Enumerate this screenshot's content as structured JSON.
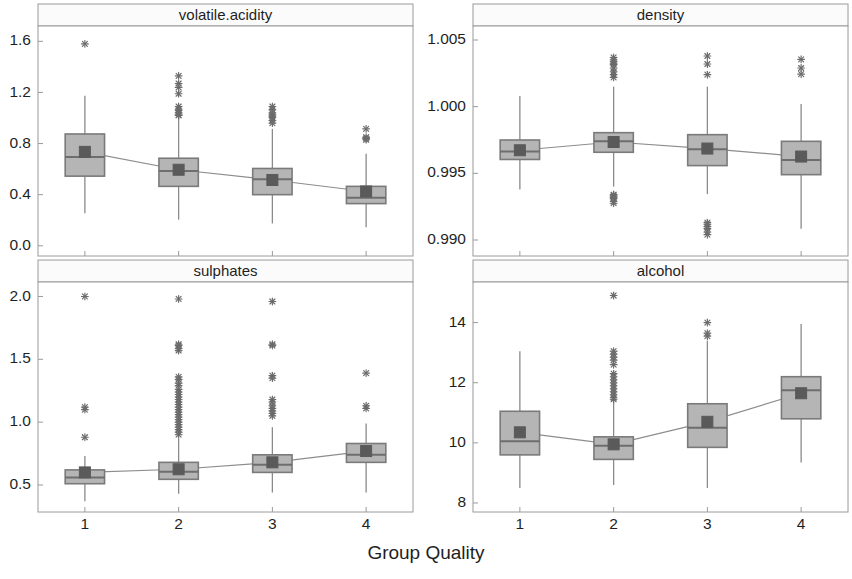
{
  "figure": {
    "background": "#ffffff",
    "xlabel": "Group Quality",
    "title_clipped": "",
    "panel_border_color": "#9a9a9a",
    "strip_background": "#fbfbfb",
    "strip_text_color": "#1f1f1f",
    "box_fill": "#b5b5b5",
    "box_border": "#7a7a7a",
    "whisker_color": "#8a8a8a",
    "median_color": "#6e6e6e",
    "outlier_color": "#6b6b6b",
    "mean_marker_color": "#5a5a5a",
    "mean_line_color": "#8d8d8d"
  },
  "chart_data": [
    {
      "type": "box",
      "panel": "top-left",
      "title": "volatile.acidity",
      "xlabel": "Group Quality",
      "ylabel": "",
      "categories": [
        "1",
        "2",
        "3",
        "4"
      ],
      "ylim": [
        -0.08,
        1.72
      ],
      "yticks": [
        0.0,
        0.4,
        0.8,
        1.2,
        1.6
      ],
      "ytick_labels": [
        "0.0",
        "0.4",
        "0.8",
        "1.2",
        "1.6"
      ],
      "grid": false,
      "boxes": [
        {
          "category": "1",
          "min": 0.255,
          "q1": 0.545,
          "median": 0.695,
          "q3": 0.875,
          "max": 1.175,
          "mean": 0.735,
          "outliers": [
            1.58
          ]
        },
        {
          "category": "2",
          "min": 0.205,
          "q1": 0.465,
          "median": 0.585,
          "q3": 0.685,
          "max": 1.005,
          "mean": 0.595,
          "outliers": [
            1.33,
            1.27,
            1.24,
            1.19,
            1.09,
            1.07,
            1.06,
            1.04,
            1.025,
            1.02
          ]
        },
        {
          "category": "3",
          "min": 0.175,
          "q1": 0.4,
          "median": 0.52,
          "q3": 0.605,
          "max": 0.915,
          "mean": 0.515,
          "outliers": [
            1.09,
            1.065,
            1.04,
            1.025,
            1.015,
            1.005,
            0.98,
            0.96
          ]
        },
        {
          "category": "4",
          "min": 0.145,
          "q1": 0.33,
          "median": 0.375,
          "q3": 0.465,
          "max": 0.72,
          "mean": 0.425,
          "outliers": [
            0.915,
            0.85,
            0.84,
            0.83
          ]
        }
      ],
      "mean_trend": [
        0.735,
        0.595,
        0.515,
        0.425
      ]
    },
    {
      "type": "box",
      "panel": "top-right",
      "title": "density",
      "xlabel": "Group Quality",
      "ylabel": "",
      "categories": [
        "1",
        "2",
        "3",
        "4"
      ],
      "ylim": [
        0.9888,
        1.00605
      ],
      "yticks": [
        0.99,
        0.995,
        1.0,
        1.005
      ],
      "ytick_labels": [
        "0.990",
        "0.995",
        "1.000",
        "1.005"
      ],
      "grid": false,
      "boxes": [
        {
          "category": "1",
          "min": 0.99378,
          "q1": 0.99604,
          "median": 0.99664,
          "q3": 0.9975,
          "max": 1.0008,
          "mean": 0.99673,
          "outliers": []
        },
        {
          "category": "2",
          "min": 0.994,
          "q1": 0.99658,
          "median": 0.9974,
          "q3": 0.99805,
          "max": 1.0015,
          "mean": 0.99735,
          "outliers": [
            1.00369,
            1.00352,
            1.00339,
            1.00326,
            1.00315,
            1.0029,
            1.00262,
            1.0024,
            1.0022,
            0.99341,
            0.99336,
            0.99328,
            0.9932,
            0.9931,
            0.9929,
            0.99276
          ]
        },
        {
          "category": "3",
          "min": 0.99344,
          "q1": 0.99558,
          "median": 0.9968,
          "q3": 0.9979,
          "max": 1.0015,
          "mean": 0.99686,
          "outliers": [
            1.0038,
            1.0032,
            1.0024,
            0.9913,
            0.99118,
            0.991,
            0.99085,
            0.9906,
            0.9904
          ]
        },
        {
          "category": "4",
          "min": 0.99084,
          "q1": 0.9949,
          "median": 0.996,
          "q3": 0.9974,
          "max": 1.0002,
          "mean": 0.99626,
          "outliers": [
            1.00355,
            1.0029,
            1.00244
          ]
        }
      ],
      "mean_trend": [
        0.99673,
        0.99735,
        0.99686,
        0.99626
      ]
    },
    {
      "type": "box",
      "panel": "bottom-left",
      "title": "sulphates",
      "xlabel": "Group Quality",
      "ylabel": "",
      "categories": [
        "1",
        "2",
        "3",
        "4"
      ],
      "ylim": [
        0.285,
        2.115
      ],
      "yticks": [
        0.5,
        1.0,
        1.5,
        2.0
      ],
      "ytick_labels": [
        "0.5",
        "1.0",
        "1.5",
        "2.0"
      ],
      "grid": false,
      "boxes": [
        {
          "category": "1",
          "min": 0.37,
          "q1": 0.51,
          "median": 0.56,
          "q3": 0.62,
          "max": 0.73,
          "mean": 0.6,
          "outliers": [
            2.0,
            1.12,
            1.1,
            0.88
          ]
        },
        {
          "category": "2",
          "min": 0.43,
          "q1": 0.545,
          "median": 0.605,
          "q3": 0.68,
          "max": 0.87,
          "mean": 0.625,
          "outliers": [
            1.98,
            1.62,
            1.61,
            1.585,
            1.57,
            1.36,
            1.34,
            1.31,
            1.29,
            1.26,
            1.24,
            1.22,
            1.2,
            1.18,
            1.16,
            1.14,
            1.12,
            1.1,
            1.08,
            1.06,
            1.04,
            1.02,
            1.0,
            0.98,
            0.96,
            0.94,
            0.92,
            0.9
          ]
        },
        {
          "category": "3",
          "min": 0.44,
          "q1": 0.6,
          "median": 0.66,
          "q3": 0.74,
          "max": 0.96,
          "mean": 0.68,
          "outliers": [
            1.96,
            1.62,
            1.61,
            1.37,
            1.35,
            1.18,
            1.16,
            1.13,
            1.11,
            1.09,
            1.07,
            1.05
          ]
        },
        {
          "category": "4",
          "min": 0.44,
          "q1": 0.68,
          "median": 0.74,
          "q3": 0.83,
          "max": 0.99,
          "mean": 0.77,
          "outliers": [
            1.39,
            1.13,
            1.11
          ]
        }
      ],
      "mean_trend": [
        0.6,
        0.625,
        0.68,
        0.77
      ]
    },
    {
      "type": "box",
      "panel": "bottom-right",
      "title": "alcohol",
      "xlabel": "Group Quality",
      "ylabel": "",
      "categories": [
        "1",
        "2",
        "3",
        "4"
      ],
      "ylim": [
        7.7,
        15.35
      ],
      "yticks": [
        8,
        10,
        12,
        14
      ],
      "ytick_labels": [
        "8",
        "10",
        "12",
        "14"
      ],
      "grid": false,
      "boxes": [
        {
          "category": "1",
          "min": 8.5,
          "q1": 9.6,
          "median": 10.05,
          "q3": 11.05,
          "max": 13.05,
          "mean": 10.35,
          "outliers": []
        },
        {
          "category": "2",
          "min": 8.6,
          "q1": 9.45,
          "median": 9.9,
          "q3": 10.2,
          "max": 11.35,
          "mean": 9.95,
          "outliers": [
            14.9,
            13.05,
            12.95,
            12.85,
            12.75,
            12.6,
            12.3,
            12.2,
            12.1,
            12.0,
            11.9,
            11.8,
            11.7,
            11.6,
            11.5,
            11.45
          ]
        },
        {
          "category": "3",
          "min": 8.5,
          "q1": 9.85,
          "median": 10.5,
          "q3": 11.3,
          "max": 13.4,
          "mean": 10.7,
          "outliers": [
            14.0,
            13.65,
            13.55
          ]
        },
        {
          "category": "4",
          "min": 9.35,
          "q1": 10.8,
          "median": 11.75,
          "q3": 12.2,
          "max": 13.95,
          "mean": 11.65,
          "outliers": []
        }
      ],
      "mean_trend": [
        10.35,
        9.95,
        10.7,
        11.65
      ]
    }
  ],
  "layout": {
    "panels": [
      {
        "key": "top-left",
        "x": 38,
        "y": 4,
        "w": 375,
        "h": 252,
        "strip_h": 22,
        "yaxis_side": "left"
      },
      {
        "key": "top-right",
        "x": 473,
        "y": 4,
        "w": 375,
        "h": 252,
        "strip_h": 22,
        "yaxis_side": "left"
      },
      {
        "key": "bottom-left",
        "x": 38,
        "y": 260,
        "w": 375,
        "h": 252,
        "strip_h": 22,
        "yaxis_side": "left"
      },
      {
        "key": "bottom-right",
        "x": 473,
        "y": 260,
        "w": 375,
        "h": 252,
        "strip_h": 22,
        "yaxis_side": "left"
      }
    ],
    "xlabel_y": 545,
    "xtick_label_y": 518
  }
}
